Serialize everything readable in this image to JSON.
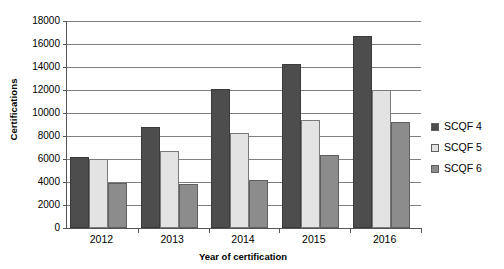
{
  "chart_data": {
    "type": "bar",
    "title": "",
    "xlabel": "Year of certification",
    "ylabel": "Certifications",
    "categories": [
      "2012",
      "2013",
      "2014",
      "2015",
      "2016"
    ],
    "series": [
      {
        "name": "SCQF 4",
        "color": "#4d4d4d",
        "values": [
          6150,
          8800,
          12050,
          14250,
          16700
        ]
      },
      {
        "name": "SCQF 5",
        "color": "#e3e3e3",
        "values": [
          6000,
          6700,
          8300,
          9400,
          12000
        ]
      },
      {
        "name": "SCQF 6",
        "color": "#8c8c8c",
        "values": [
          3900,
          3850,
          4200,
          6350,
          9250
        ]
      }
    ],
    "ylim": [
      0,
      18000
    ],
    "ytick_step": 2000,
    "yticks": [
      "18000",
      "16000",
      "14000",
      "12000",
      "10000",
      "8000",
      "6000",
      "4000",
      "2000",
      "0"
    ],
    "grid": "horizontal",
    "legend_position": "right"
  }
}
